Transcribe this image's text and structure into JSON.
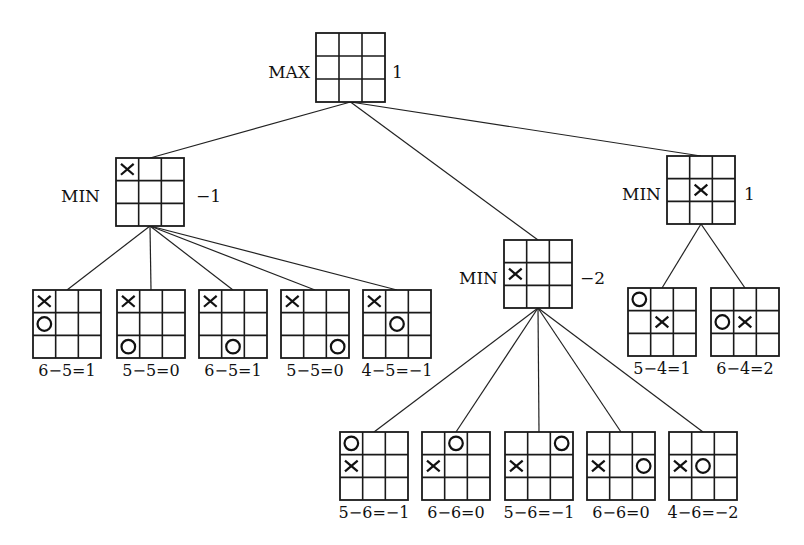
{
  "style": {
    "line_color": "#1a1a1a",
    "background": "#ffffff"
  },
  "root": {
    "id": "root",
    "label": "MAX",
    "value": "1",
    "board": [
      "",
      "",
      "",
      "",
      "",
      "",
      "",
      "",
      ""
    ],
    "box": {
      "x": 316,
      "y": 33,
      "size": 69
    },
    "label_pos": {
      "x": 310,
      "y": 73,
      "anchor": "end"
    },
    "value_pos": {
      "x": 392,
      "y": 73
    }
  },
  "min_nodes": [
    {
      "id": "min-left",
      "label": "MIN",
      "value": "−1",
      "board": [
        "X",
        "",
        "",
        "",
        "",
        "",
        "",
        "",
        ""
      ],
      "box": {
        "x": 116,
        "y": 158,
        "size": 68
      },
      "label_pos": {
        "x": 100,
        "y": 197,
        "anchor": "end"
      },
      "value_pos": {
        "x": 196,
        "y": 197
      }
    },
    {
      "id": "min-middle",
      "label": "MIN",
      "value": "−2",
      "board": [
        "",
        "",
        "",
        "X",
        "",
        "",
        "",
        "",
        ""
      ],
      "box": {
        "x": 504,
        "y": 240,
        "size": 68
      },
      "label_pos": {
        "x": 498,
        "y": 279,
        "anchor": "end"
      },
      "value_pos": {
        "x": 580,
        "y": 279
      }
    },
    {
      "id": "min-right",
      "label": "MIN",
      "value": "1",
      "board": [
        "",
        "",
        "",
        "",
        "X",
        "",
        "",
        "",
        ""
      ],
      "box": {
        "x": 667,
        "y": 156,
        "size": 68
      },
      "label_pos": {
        "x": 661,
        "y": 195,
        "anchor": "end"
      },
      "value_pos": {
        "x": 744,
        "y": 195
      }
    }
  ],
  "leaves": [
    {
      "parent": "min-left",
      "board": [
        "X",
        "",
        "",
        "O",
        "",
        "",
        "",
        "",
        ""
      ],
      "eval": "6−5=1",
      "box": {
        "x": 33,
        "y": 290,
        "size": 68
      }
    },
    {
      "parent": "min-left",
      "board": [
        "X",
        "",
        "",
        "",
        "",
        "",
        "O",
        "",
        ""
      ],
      "eval": "5−5=0",
      "box": {
        "x": 117,
        "y": 290,
        "size": 68
      }
    },
    {
      "parent": "min-left",
      "board": [
        "X",
        "",
        "",
        "",
        "",
        "",
        "",
        "O",
        ""
      ],
      "eval": "6−5=1",
      "box": {
        "x": 199,
        "y": 290,
        "size": 68
      }
    },
    {
      "parent": "min-left",
      "board": [
        "X",
        "",
        "",
        "",
        "",
        "",
        "",
        "",
        "O"
      ],
      "eval": "5−5=0",
      "box": {
        "x": 281,
        "y": 290,
        "size": 68
      }
    },
    {
      "parent": "min-left",
      "board": [
        "X",
        "",
        "",
        "",
        "O",
        "",
        "",
        "",
        ""
      ],
      "eval": "4−5=−1",
      "box": {
        "x": 363,
        "y": 290,
        "size": 68
      }
    },
    {
      "parent": "min-right",
      "board": [
        "O",
        "",
        "",
        "",
        "X",
        "",
        "",
        "",
        ""
      ],
      "eval": "5−4=1",
      "box": {
        "x": 628,
        "y": 288,
        "size": 68
      }
    },
    {
      "parent": "min-right",
      "board": [
        "",
        "",
        "",
        "O",
        "X",
        "",
        "",
        "",
        ""
      ],
      "eval": "6−4=2",
      "box": {
        "x": 711,
        "y": 288,
        "size": 68
      }
    },
    {
      "parent": "min-middle",
      "board": [
        "O",
        "",
        "",
        "X",
        "",
        "",
        "",
        "",
        ""
      ],
      "eval": "5−6=−1",
      "box": {
        "x": 340,
        "y": 432,
        "size": 68
      }
    },
    {
      "parent": "min-middle",
      "board": [
        "",
        "O",
        "",
        "X",
        "",
        "",
        "",
        "",
        ""
      ],
      "eval": "6−6=0",
      "box": {
        "x": 422,
        "y": 432,
        "size": 68
      }
    },
    {
      "parent": "min-middle",
      "board": [
        "",
        "",
        "O",
        "X",
        "",
        "",
        "",
        "",
        ""
      ],
      "eval": "5−6=−1",
      "box": {
        "x": 505,
        "y": 432,
        "size": 68
      }
    },
    {
      "parent": "min-middle",
      "board": [
        "",
        "",
        "",
        "X",
        "",
        "O",
        "",
        "",
        ""
      ],
      "eval": "6−6=0",
      "box": {
        "x": 587,
        "y": 432,
        "size": 68
      }
    },
    {
      "parent": "min-middle",
      "board": [
        "",
        "",
        "",
        "X",
        "O",
        "",
        "",
        "",
        ""
      ],
      "eval": "4−6=−2",
      "box": {
        "x": 669,
        "y": 432,
        "size": 68
      }
    }
  ]
}
